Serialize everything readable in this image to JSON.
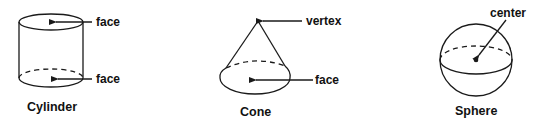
{
  "figures": [
    {
      "name": "Cylinder",
      "labels": {
        "top": "face",
        "bottom": "face"
      }
    },
    {
      "name": "Cone",
      "labels": {
        "apex": "vertex",
        "base": "face"
      }
    },
    {
      "name": "Sphere",
      "labels": {
        "center": "center"
      }
    }
  ],
  "colors": {
    "stroke": "#1a1a1a",
    "background": "#ffffff"
  }
}
